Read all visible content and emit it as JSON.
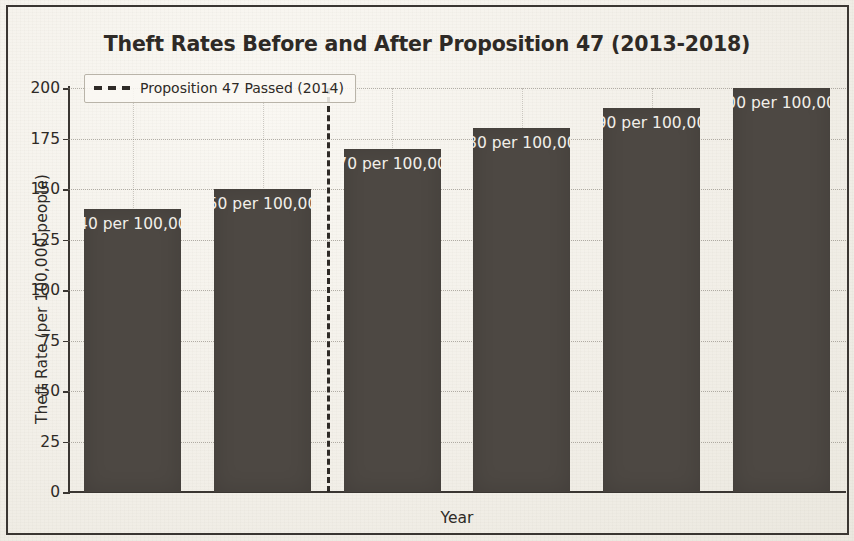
{
  "chart_data": {
    "type": "bar",
    "title": "Theft Rates Before and After Proposition 47 (2013-2018)",
    "xlabel": "Year",
    "ylabel": "Theft Rate (per 100,000 people)",
    "categories": [
      "2013 (Before Prop 47)",
      "2014 (After Prop 47)",
      "2015",
      "2016",
      "2017",
      "2018"
    ],
    "values": [
      140,
      150,
      170,
      180,
      190,
      200
    ],
    "bar_labels": [
      "140 per 100,000",
      "150 per 100,000",
      "170 per 100,000",
      "180 per 100,000",
      "190 per 100,000",
      "200 per 100,000"
    ],
    "ylim": [
      0,
      200
    ],
    "yticks": [
      0,
      25,
      50,
      75,
      100,
      125,
      150,
      175,
      200
    ],
    "ytick_labels": [
      "0",
      "25",
      "50",
      "75",
      "100",
      "125",
      "150",
      "175",
      "200"
    ],
    "grid": true,
    "legend_position": "upper left",
    "legend": [
      {
        "label": "Proposition 47 Passed (2014)",
        "style": "dashed-line",
        "color": "#2e2a26"
      }
    ],
    "annotations": [
      {
        "type": "vertical-line",
        "label": "Proposition 47 Passed (2014)",
        "between_categories": [
          "2014 (After Prop 47)",
          "2015"
        ],
        "style": "dashed",
        "color": "#2e2a26"
      }
    ],
    "bar_color": "#4d4843",
    "background_color": "#f4f2ec"
  }
}
